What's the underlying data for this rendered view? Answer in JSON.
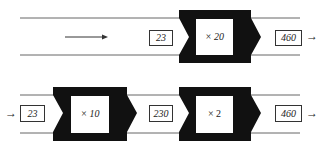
{
  "colors": {
    "ink": "#111111",
    "line": "#555555",
    "paper": "#ffffff"
  },
  "rows": [
    {
      "input_value": "23",
      "machines": [
        {
          "label": "× 20"
        }
      ],
      "output_value": "460"
    },
    {
      "input_value": "23",
      "machines": [
        {
          "label": "× 10"
        },
        {
          "label": "× 2"
        }
      ],
      "intermediate_value": "230",
      "output_value": "460"
    }
  ],
  "icons": {
    "arrow": "→"
  }
}
